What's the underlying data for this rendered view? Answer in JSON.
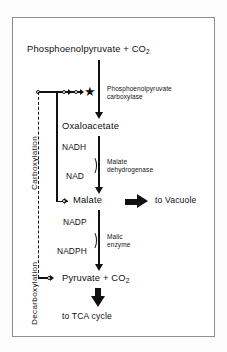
{
  "figure": {
    "type": "biochemical-pathway-diagram",
    "title_text": "CAM / C4 organic acid metabolism pathway",
    "border_color": "#8d8d8d",
    "ink_color": "#111111"
  },
  "side_labels": {
    "carboxylation": "Carboxylation",
    "decarboxylation": "Decarboxylation"
  },
  "nodes": {
    "pep": {
      "text": "Phosphoenolpyruvate + CO",
      "sub": "2"
    },
    "oaa": {
      "text": "Oxaloacetate"
    },
    "malate": {
      "text": "Malate"
    },
    "pyruvate": {
      "text": "Pyruvate + CO",
      "sub": "2"
    }
  },
  "enzymes": {
    "pepc_line1": "Phosphoenolpyruvate",
    "pepc_line2": "carboxylase",
    "mdh_line1": "Malate",
    "mdh_line2": "dehydrogenase",
    "me_line1": "Malic",
    "me_line2": "enzyme"
  },
  "cofactors": {
    "nadh": "NADH",
    "nad": "NAD",
    "nadp": "NADP",
    "nadph": "NADPH"
  },
  "destinations": {
    "vacuole": "to Vacuole",
    "tca": "to TCA cycle"
  },
  "regulation": {
    "marker_glyph": "★",
    "marker_meaning": "regulated-enzyme-star",
    "feedback_from_malate": "malate inhibits PEP carboxylase",
    "feedback_from_pyruvate": "pyruvate feedback to PEP carboxylase"
  }
}
